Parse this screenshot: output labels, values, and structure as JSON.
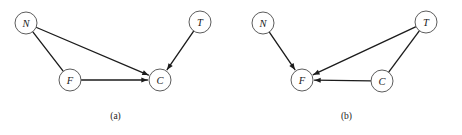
{
  "figure": {
    "background_color": "#ffffff",
    "node_fill": "#ffffff",
    "node_stroke": "#4a4a4a",
    "edge_color": "#1c1c1c",
    "label_color": "#1a1a1a"
  },
  "panels": [
    {
      "id": "a",
      "caption": "(a)",
      "nodes": [
        {
          "id": "N",
          "label": "N",
          "cx": 26,
          "cy": 23,
          "r": 11
        },
        {
          "id": "T",
          "label": "T",
          "cx": 200,
          "cy": 22,
          "r": 11
        },
        {
          "id": "F",
          "label": "F",
          "cx": 70,
          "cy": 80,
          "r": 11
        },
        {
          "id": "C",
          "label": "C",
          "cx": 160,
          "cy": 80,
          "r": 11
        }
      ],
      "edges": [
        {
          "from": "N",
          "to": "C",
          "arrow": true
        },
        {
          "from": "N",
          "to": "F",
          "arrow": false
        },
        {
          "from": "F",
          "to": "C",
          "arrow": true
        },
        {
          "from": "T",
          "to": "C",
          "arrow": true
        }
      ]
    },
    {
      "id": "b",
      "caption": "(b)",
      "nodes": [
        {
          "id": "N",
          "label": "N",
          "cx": 32,
          "cy": 23,
          "r": 11
        },
        {
          "id": "T",
          "label": "T",
          "cx": 195,
          "cy": 22,
          "r": 11
        },
        {
          "id": "F",
          "label": "F",
          "cx": 71,
          "cy": 80,
          "r": 11
        },
        {
          "id": "C",
          "label": "C",
          "cx": 151,
          "cy": 81,
          "r": 11
        }
      ],
      "edges": [
        {
          "from": "N",
          "to": "F",
          "arrow": true
        },
        {
          "from": "T",
          "to": "F",
          "arrow": true
        },
        {
          "from": "T",
          "to": "C",
          "arrow": false
        },
        {
          "from": "C",
          "to": "F",
          "arrow": true
        }
      ]
    }
  ]
}
